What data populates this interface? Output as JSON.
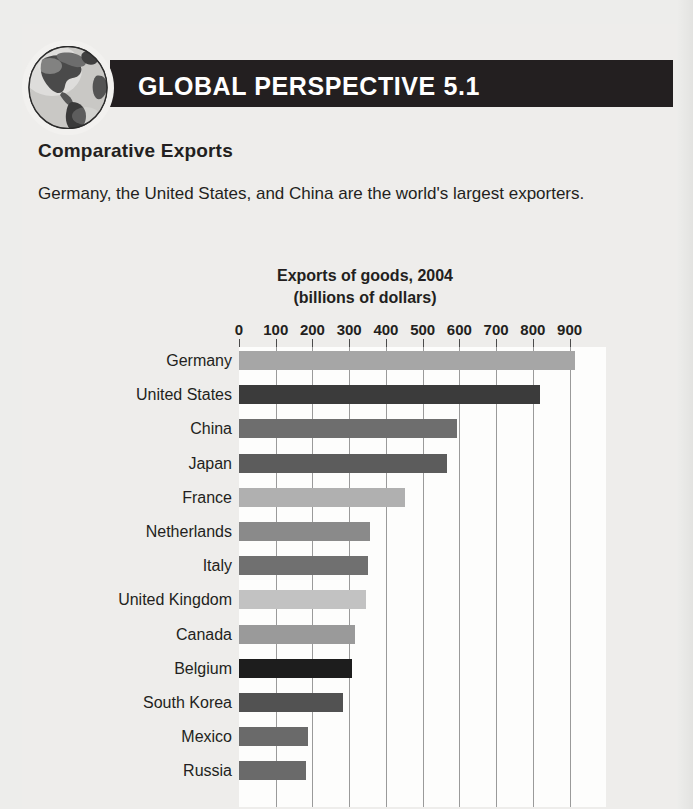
{
  "header": {
    "title": "GLOBAL PERSPECTIVE 5.1",
    "band_color": "#231f20",
    "icon": "globe-icon"
  },
  "section": {
    "heading": "Comparative Exports",
    "body": "Germany, the United States, and China are the world's largest exporters."
  },
  "chart_data": {
    "type": "bar",
    "orientation": "horizontal",
    "title": "Exports of goods, 2004",
    "subtitle": "(billions of dollars)",
    "xlabel": "",
    "ylabel": "",
    "xlim": [
      0,
      1000
    ],
    "grid": true,
    "legend": "none",
    "tick_labels": [
      "0",
      "100",
      "200",
      "300",
      "400",
      "500",
      "600",
      "700",
      "800",
      "900"
    ],
    "tick_values": [
      0,
      100,
      200,
      300,
      400,
      500,
      600,
      700,
      800,
      900
    ],
    "categories": [
      "Germany",
      "United States",
      "China",
      "Japan",
      "France",
      "Netherlands",
      "Italy",
      "United Kingdom",
      "Canada",
      "Belgium",
      "South Korea",
      "Mexico",
      "Russia"
    ],
    "values": [
      915,
      820,
      593,
      566,
      451,
      358,
      350,
      347,
      317,
      307,
      284,
      189,
      183
    ],
    "bar_colors": [
      "#a6a6a6",
      "#3b3b3b",
      "#6e6e6e",
      "#5c5c5c",
      "#b0b0b0",
      "#8a8a8a",
      "#707070",
      "#c2c2c2",
      "#9a9a9a",
      "#1d1d1d",
      "#525252",
      "#6a6a6a",
      "#6a6a6a"
    ]
  },
  "colors": {
    "page_background": "#ededeb",
    "plot_background": "#fdfdfc",
    "text": "#231f20",
    "gridline": "#9a9a9a"
  }
}
